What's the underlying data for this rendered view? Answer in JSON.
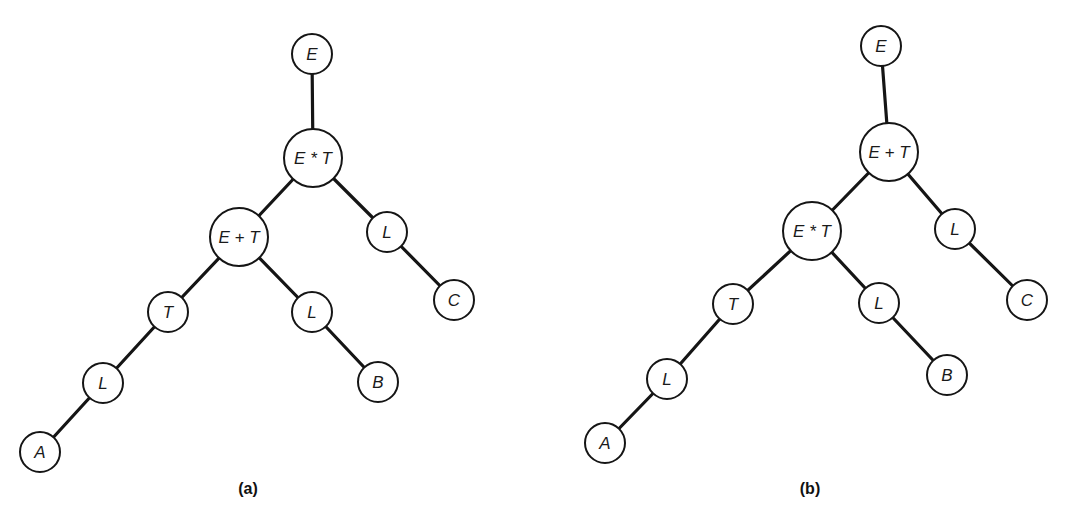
{
  "figure": {
    "panels": [
      {
        "id": "a",
        "caption": "(a)",
        "caption_pos": [
          248,
          488
        ],
        "nodes": [
          {
            "id": "E",
            "label": "E",
            "x": 312,
            "y": 54,
            "r": 20
          },
          {
            "id": "EmT",
            "label": "E * T",
            "x": 313,
            "y": 158,
            "r": 29
          },
          {
            "id": "EpT",
            "label": "E + T",
            "x": 239,
            "y": 237,
            "r": 29
          },
          {
            "id": "Lr",
            "label": "L",
            "x": 387,
            "y": 232,
            "r": 20
          },
          {
            "id": "T",
            "label": "T",
            "x": 168,
            "y": 312,
            "r": 20
          },
          {
            "id": "Lm",
            "label": "L",
            "x": 312,
            "y": 312,
            "r": 20
          },
          {
            "id": "C",
            "label": "C",
            "x": 454,
            "y": 300,
            "r": 20
          },
          {
            "id": "Ll",
            "label": "L",
            "x": 103,
            "y": 383,
            "r": 20
          },
          {
            "id": "B",
            "label": "B",
            "x": 378,
            "y": 382,
            "r": 20
          },
          {
            "id": "A",
            "label": "A",
            "x": 40,
            "y": 452,
            "r": 20
          }
        ],
        "edges": [
          [
            "E",
            "EmT"
          ],
          [
            "EmT",
            "EpT"
          ],
          [
            "EmT",
            "Lr"
          ],
          [
            "EpT",
            "T"
          ],
          [
            "EpT",
            "Lm"
          ],
          [
            "Lr",
            "C"
          ],
          [
            "T",
            "Ll"
          ],
          [
            "Lm",
            "B"
          ],
          [
            "Ll",
            "A"
          ]
        ]
      },
      {
        "id": "b",
        "caption": "(b)",
        "caption_pos": [
          810,
          488
        ],
        "nodes": [
          {
            "id": "E",
            "label": "E",
            "x": 881,
            "y": 46,
            "r": 20
          },
          {
            "id": "EpT",
            "label": "E + T",
            "x": 889,
            "y": 152,
            "r": 29
          },
          {
            "id": "EmT",
            "label": "E * T",
            "x": 812,
            "y": 231,
            "r": 29
          },
          {
            "id": "Lr",
            "label": "L",
            "x": 955,
            "y": 229,
            "r": 20
          },
          {
            "id": "T",
            "label": "T",
            "x": 733,
            "y": 304,
            "r": 20
          },
          {
            "id": "Lm",
            "label": "L",
            "x": 879,
            "y": 303,
            "r": 20
          },
          {
            "id": "C",
            "label": "C",
            "x": 1027,
            "y": 300,
            "r": 20
          },
          {
            "id": "Ll",
            "label": "L",
            "x": 667,
            "y": 379,
            "r": 20
          },
          {
            "id": "B",
            "label": "B",
            "x": 947,
            "y": 375,
            "r": 20
          },
          {
            "id": "A",
            "label": "A",
            "x": 605,
            "y": 443,
            "r": 20
          }
        ],
        "edges": [
          [
            "E",
            "EpT"
          ],
          [
            "EpT",
            "EmT"
          ],
          [
            "EpT",
            "Lr"
          ],
          [
            "EmT",
            "T"
          ],
          [
            "EmT",
            "Lm"
          ],
          [
            "Lr",
            "C"
          ],
          [
            "T",
            "Ll"
          ],
          [
            "Lm",
            "B"
          ],
          [
            "Ll",
            "A"
          ]
        ]
      }
    ],
    "colors": {
      "stroke": "#151515",
      "fill": "#ffffff",
      "background": "#ffffff"
    }
  }
}
